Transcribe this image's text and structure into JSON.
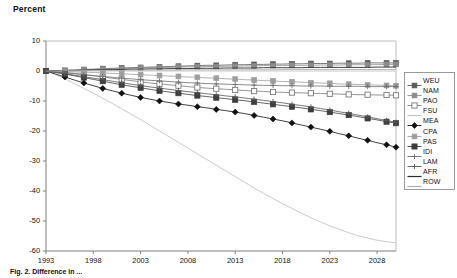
{
  "figure": {
    "axis_title": "Percent",
    "caption": "Fig. 2. Difference in ..."
  },
  "chart_data": {
    "type": "line",
    "title": "Percent",
    "xlabel": "",
    "ylabel": "Percent",
    "xlim": [
      1993,
      2030
    ],
    "ylim": [
      -60,
      10
    ],
    "ytick_labels": [
      "10",
      "0",
      "-10",
      "-20",
      "-30",
      "-40",
      "-50",
      "-60"
    ],
    "yticks": [
      10,
      0,
      -10,
      -20,
      -30,
      -40,
      -50,
      -60
    ],
    "xtick_labels": [
      "1993",
      "1998",
      "2003",
      "2008",
      "2013",
      "2018",
      "2023",
      "2028"
    ],
    "xticks": [
      1993,
      1998,
      2003,
      2008,
      2013,
      2018,
      2023,
      2028
    ],
    "grid": false,
    "legend_position": "right",
    "x": [
      1993,
      1994,
      1995,
      1996,
      1997,
      1998,
      1999,
      2000,
      2001,
      2002,
      2003,
      2004,
      2005,
      2006,
      2007,
      2008,
      2009,
      2010,
      2011,
      2012,
      2013,
      2014,
      2015,
      2016,
      2017,
      2018,
      2019,
      2020,
      2021,
      2022,
      2023,
      2024,
      2025,
      2026,
      2027,
      2028,
      2029,
      2030
    ],
    "series": [
      {
        "name": "WEU",
        "color": "#5a5a5a",
        "marker": "square-small",
        "values": [
          0,
          0.1,
          0.2,
          0.3,
          0.5,
          0.6,
          0.8,
          0.9,
          1.0,
          1.1,
          1.2,
          1.3,
          1.4,
          1.5,
          1.6,
          1.7,
          1.8,
          1.9,
          1.9,
          2.0,
          2.1,
          2.1,
          2.2,
          2.2,
          2.3,
          2.3,
          2.4,
          2.4,
          2.5,
          2.5,
          2.5,
          2.6,
          2.6,
          2.6,
          2.7,
          2.7,
          2.7,
          2.7
        ]
      },
      {
        "name": "NAM",
        "color": "#8c8c8c",
        "marker": "square-small",
        "values": [
          0,
          0.1,
          0.2,
          0.3,
          0.4,
          0.5,
          0.6,
          0.7,
          0.8,
          0.9,
          1.0,
          1.1,
          1.2,
          1.2,
          1.3,
          1.4,
          1.4,
          1.5,
          1.5,
          1.6,
          1.6,
          1.7,
          1.7,
          1.8,
          1.8,
          1.8,
          1.9,
          1.9,
          1.9,
          2.0,
          2.0,
          2.0,
          2.1,
          2.1,
          2.1,
          2.1,
          2.2,
          2.2
        ]
      },
      {
        "name": "PAO",
        "color": "#7a7a7a",
        "marker": "square-open",
        "values": [
          0,
          -0.2,
          -0.5,
          -0.8,
          -1.2,
          -1.6,
          -2.0,
          -2.4,
          -2.8,
          -3.2,
          -3.6,
          -4.0,
          -4.3,
          -4.6,
          -4.9,
          -5.2,
          -5.5,
          -5.7,
          -5.9,
          -6.1,
          -6.3,
          -6.5,
          -6.7,
          -6.8,
          -7.0,
          -7.1,
          -7.2,
          -7.3,
          -7.4,
          -7.5,
          -7.6,
          -7.7,
          -7.8,
          -7.9,
          -7.9,
          -8.0,
          -8.0,
          -8.1
        ]
      },
      {
        "name": "FSU",
        "color": "#c4c4c4",
        "marker": "none",
        "values": [
          0,
          -1.2,
          -2.6,
          -4.2,
          -5.8,
          -7.4,
          -9.1,
          -10.8,
          -12.6,
          -14.4,
          -16.2,
          -18.1,
          -20.0,
          -21.9,
          -23.8,
          -25.7,
          -27.6,
          -29.5,
          -31.4,
          -33.3,
          -35.2,
          -37.1,
          -39.0,
          -40.8,
          -42.5,
          -44.2,
          -45.8,
          -47.4,
          -48.9,
          -50.3,
          -51.6,
          -52.8,
          -53.9,
          -54.9,
          -55.7,
          -56.4,
          -56.9,
          -57.3
        ]
      },
      {
        "name": "MEA",
        "color": "#111111",
        "marker": "diamond-filled",
        "values": [
          0,
          -1.0,
          -2.0,
          -3.0,
          -4.0,
          -4.9,
          -5.8,
          -6.6,
          -7.4,
          -8.1,
          -8.8,
          -9.4,
          -10.0,
          -10.5,
          -11.0,
          -11.4,
          -11.9,
          -12.3,
          -12.8,
          -13.2,
          -13.7,
          -14.2,
          -14.8,
          -15.4,
          -16.0,
          -16.6,
          -17.3,
          -18.0,
          -18.7,
          -19.4,
          -20.1,
          -20.9,
          -21.6,
          -22.4,
          -23.1,
          -23.9,
          -24.6,
          -25.4
        ]
      },
      {
        "name": "CPA",
        "color": "#9e9e9e",
        "marker": "square-small",
        "values": [
          0,
          -0.1,
          -0.2,
          -0.3,
          -0.4,
          -0.5,
          -0.6,
          -0.8,
          -0.9,
          -1.1,
          -1.2,
          -1.4,
          -1.5,
          -1.7,
          -1.8,
          -2.0,
          -2.1,
          -2.3,
          -2.4,
          -2.6,
          -2.7,
          -2.9,
          -3.0,
          -3.2,
          -3.3,
          -3.5,
          -3.6,
          -3.7,
          -3.9,
          -4.0,
          -4.1,
          -4.3,
          -4.4,
          -4.5,
          -4.6,
          -4.7,
          -4.8,
          -4.9
        ]
      },
      {
        "name": "PAS",
        "color": "#3d3d3d",
        "marker": "square-filled",
        "values": [
          0,
          -0.5,
          -1.0,
          -1.6,
          -2.2,
          -2.8,
          -3.4,
          -4.0,
          -4.6,
          -5.1,
          -5.6,
          -6.1,
          -6.6,
          -7.0,
          -7.4,
          -7.8,
          -8.2,
          -8.5,
          -8.9,
          -9.2,
          -9.6,
          -9.9,
          -10.3,
          -10.7,
          -11.1,
          -11.5,
          -11.9,
          -12.3,
          -12.8,
          -13.2,
          -13.7,
          -14.2,
          -14.7,
          -15.2,
          -15.8,
          -16.3,
          -16.9,
          -17.4
        ]
      },
      {
        "name": "IDI",
        "color": "#6e6e6e",
        "marker": "plus",
        "values": [
          0,
          -0.3,
          -0.6,
          -0.9,
          -1.2,
          -1.5,
          -1.8,
          -2.1,
          -2.4,
          -2.6,
          -2.9,
          -3.1,
          -3.3,
          -3.5,
          -3.7,
          -3.9,
          -4.0,
          -4.2,
          -4.3,
          -4.4,
          -4.5,
          -4.6,
          -4.7,
          -4.8,
          -4.8,
          -4.9,
          -4.9,
          -5.0,
          -5.0,
          -5.0,
          -5.1,
          -5.1,
          -5.1,
          -5.1,
          -5.2,
          -5.2,
          -5.2,
          -5.2
        ]
      },
      {
        "name": "LAM",
        "color": "#555555",
        "marker": "plus",
        "values": [
          0,
          -0.4,
          -0.9,
          -1.4,
          -1.9,
          -2.4,
          -2.9,
          -3.4,
          -3.9,
          -4.4,
          -4.9,
          -5.3,
          -5.7,
          -6.1,
          -6.5,
          -6.9,
          -7.2,
          -7.6,
          -7.9,
          -8.3,
          -8.6,
          -9.0,
          -9.4,
          -9.8,
          -10.2,
          -10.6,
          -11.1,
          -11.5,
          -12.0,
          -12.5,
          -13.0,
          -13.6,
          -14.1,
          -14.7,
          -15.3,
          -15.9,
          -16.5,
          -17.1
        ]
      },
      {
        "name": "AFR",
        "color": "#2b2b2b",
        "marker": "none",
        "values": [
          0,
          0.1,
          0.2,
          0.2,
          0.3,
          0.4,
          0.4,
          0.5,
          0.5,
          0.6,
          0.6,
          0.7,
          0.7,
          0.8,
          0.8,
          0.8,
          0.9,
          0.9,
          0.9,
          1.0,
          1.0,
          1.0,
          1.0,
          1.1,
          1.1,
          1.1,
          1.1,
          1.1,
          1.2,
          1.2,
          1.2,
          1.2,
          1.2,
          1.2,
          1.2,
          1.3,
          1.3,
          1.3
        ]
      },
      {
        "name": "ROW",
        "color": "#b0b0b0",
        "marker": "none",
        "values": [
          0,
          0.0,
          0.1,
          0.1,
          0.1,
          0.2,
          0.2,
          0.2,
          0.2,
          0.3,
          0.3,
          0.3,
          0.3,
          0.3,
          0.3,
          0.4,
          0.4,
          0.4,
          0.4,
          0.4,
          0.4,
          0.4,
          0.4,
          0.4,
          0.4,
          0.5,
          0.5,
          0.5,
          0.5,
          0.5,
          0.5,
          0.5,
          0.5,
          0.5,
          0.5,
          0.5,
          0.5,
          0.5
        ]
      }
    ]
  }
}
